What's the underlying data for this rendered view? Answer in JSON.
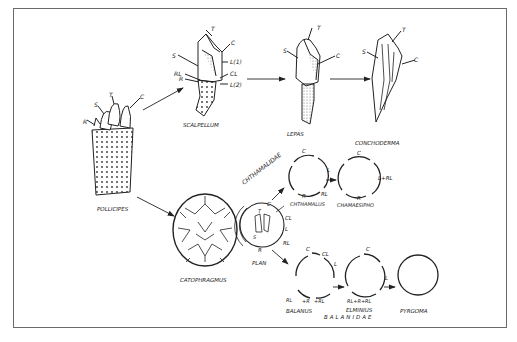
{
  "figure": {
    "frame_color": "#6a6a6a",
    "ink_color": "#222222"
  },
  "organisms": {
    "pollicipes": {
      "name": "POLLICIPES",
      "plates": [
        "R",
        "S",
        "T",
        "C"
      ]
    },
    "scalpellum": {
      "name": "SCALPELLUM",
      "plates": [
        "T",
        "C",
        "S",
        "L(1)",
        "RL",
        "CL",
        "R",
        "L(2)"
      ]
    },
    "lepas": {
      "name": "LEPAS",
      "plates": [
        "T",
        "S",
        "C"
      ]
    },
    "conchoderma": {
      "name": "CONCHODERMA",
      "plates": [
        "T",
        "S",
        "C"
      ]
    },
    "catophragmus": {
      "name": "CATOPHRAGMUS"
    },
    "plan": {
      "name": "PLAN",
      "plates": [
        "C",
        "CL",
        "L",
        "RL",
        "R",
        "T",
        "S"
      ]
    },
    "chthamalus": {
      "name": "CHTHAMALUS",
      "plates": [
        "C",
        "L",
        "RL",
        "R"
      ]
    },
    "chamaesipho": {
      "name": "CHAMAESIPHO",
      "plates": [
        "C",
        "L+RL",
        "R"
      ]
    },
    "balanus": {
      "name": "BALANUS",
      "plates": [
        "C",
        "CL",
        "L",
        "RL",
        "+R",
        "+RL"
      ]
    },
    "elminius": {
      "name": "ELMINIUS",
      "plates": [
        "C",
        "L",
        "RL+R+RL"
      ]
    },
    "pyrgoma": {
      "name": "PYRGOMA"
    }
  },
  "families": {
    "chthamalidae": "CHTHAMALIDAE",
    "balanidae": "BALANIDAE"
  },
  "labels": {
    "poll_R": "R",
    "poll_S": "S",
    "poll_T": "T",
    "poll_C": "C",
    "sc_T": "T",
    "sc_C": "C",
    "sc_S": "S",
    "sc_L1": "L(1)",
    "sc_RL": "RL",
    "sc_CL": "CL",
    "sc_R": "R",
    "sc_L2": "L(2)",
    "le_T": "T",
    "le_S": "S",
    "le_C": "C",
    "co_T": "T",
    "co_S": "S",
    "co_C": "C",
    "pl_C": "C",
    "pl_CL": "CL",
    "pl_L": "L",
    "pl_RL": "RL",
    "pl_R": "R",
    "pl_T": "T",
    "pl_S": "S",
    "ch_C": "C",
    "ch_L": "L",
    "ch_RL": "RL",
    "ch_R": "R",
    "cm_C": "C",
    "cm_LRL": "L+RL",
    "cm_R": "R",
    "ba_C": "C",
    "ba_CL": "CL",
    "ba_L": "L",
    "ba_RL": "RL",
    "ba_R": "+R",
    "ba_RL2": "+RL",
    "el_C": "C",
    "el_L": "L",
    "el_RRL": "RL+R+RL"
  }
}
